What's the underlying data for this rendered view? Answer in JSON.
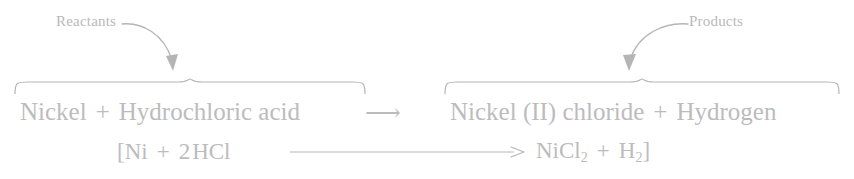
{
  "diagram": {
    "type": "chemical-equation-annotated",
    "annotations": {
      "reactants_label": "Reactants",
      "products_label": "Products"
    },
    "word_equation": {
      "left": {
        "reactant_1": "Nickel",
        "operator": "+",
        "reactant_2": "Hydrochloric acid"
      },
      "arrow": "⟶",
      "right": {
        "product_1": "Nickel (II) chloride",
        "operator": "+",
        "product_2": "Hydrogen"
      }
    },
    "symbol_equation": {
      "open_bracket": "[",
      "left": {
        "reactant_1": "Ni",
        "operator": "+",
        "coefficient_2": "2",
        "reactant_2_base": "HCl"
      },
      "arrow": "⟶",
      "right": {
        "product_1_base": "NiCl",
        "product_1_sub": "2",
        "operator": "+",
        "product_2_base": "H",
        "product_2_sub": "2"
      },
      "close_bracket": "]"
    },
    "colors": {
      "text": "#bcbcbc",
      "label": "#b9b9b9",
      "stroke": "#b5b5b5",
      "background": "#ffffff"
    }
  }
}
